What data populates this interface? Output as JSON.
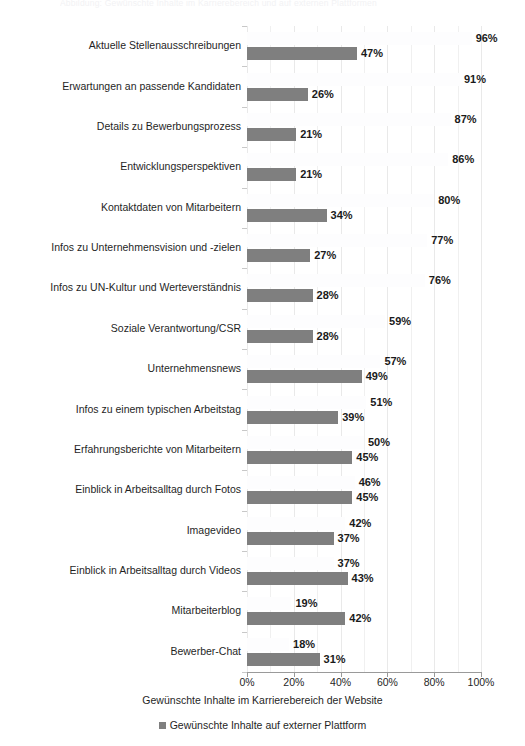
{
  "top_caption": "Abbildung: Gewünschte Inhalte im Karrierebereich und auf externen Plattformen",
  "axis": {
    "x_title": "Gewünschte Inhalte im Karrierebereich der Website",
    "x_ticks": [
      "0%",
      "20%",
      "40%",
      "60%",
      "80%",
      "100%"
    ]
  },
  "legend": {
    "items": [
      {
        "label": "Gewünschte Inhalte auf externer Plattform",
        "color": "#7f7f7f"
      }
    ]
  },
  "colors": {
    "series_a": "#fdfdfe",
    "series_b": "#7f7f7f",
    "gridline": "#f0f0f0",
    "axis": "#9a9a9a",
    "text": "#1f1f1f"
  },
  "chart_data": {
    "type": "bar",
    "orientation": "horizontal",
    "title": "",
    "xlabel": "Gewünschte Inhalte im Karrierebereich der Website",
    "ylabel": "",
    "xlim": [
      0,
      100
    ],
    "xticks": [
      0,
      20,
      40,
      60,
      80,
      100
    ],
    "xtick_labels": [
      "0%",
      "20%",
      "40%",
      "60%",
      "80%",
      "100%"
    ],
    "grid": true,
    "legend_position": "bottom",
    "value_suffix": "%",
    "categories": [
      "Aktuelle Stellenausschreibungen",
      "Erwartungen an passende Kandidaten",
      "Details zu Bewerbungsprozess",
      "Entwicklungsperspektiven",
      "Kontaktdaten von Mitarbeitern",
      "Infos zu Unternehmensvision und -zielen",
      "Infos zu UN-Kultur und Werteverständnis",
      "Soziale Verantwortung/CSR",
      "Unternehmensnews",
      "Infos zu einem typischen Arbeitstag",
      "Erfahrungsberichte von Mitarbeitern",
      "Einblick in Arbeitsalltag durch Fotos",
      "Imagevideo",
      "Einblick in Arbeitsalltag durch Videos",
      "Mitarbeiterblog",
      "Bewerber-Chat"
    ],
    "series": [
      {
        "name": "Gewünschte Inhalte im Karrierebereich der Website",
        "color": "#fdfdfe",
        "values": [
          96,
          91,
          87,
          86,
          80,
          77,
          76,
          59,
          57,
          51,
          50,
          46,
          42,
          37,
          19,
          18
        ],
        "labels": [
          "96%",
          "91%",
          "87%",
          "86%",
          "80%",
          "77%",
          "76%",
          "59%",
          "57%",
          "51%",
          "50%",
          "46%",
          "42%",
          "37%",
          "19%",
          "18%"
        ]
      },
      {
        "name": "Gewünschte Inhalte auf externer Plattform",
        "color": "#7f7f7f",
        "values": [
          47,
          26,
          21,
          21,
          34,
          27,
          28,
          28,
          49,
          39,
          45,
          45,
          37,
          43,
          42,
          31
        ],
        "labels": [
          "47%",
          "26%",
          "21%",
          "21%",
          "34%",
          "27%",
          "28%",
          "28%",
          "49%",
          "39%",
          "45%",
          "45%",
          "37%",
          "43%",
          "42%",
          "31%"
        ]
      }
    ]
  }
}
